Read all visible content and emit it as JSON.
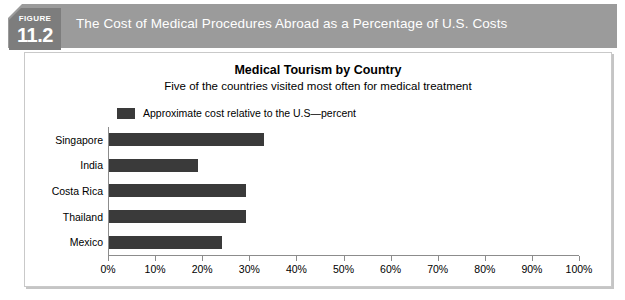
{
  "figure": {
    "kicker": "FIGURE",
    "number": "11.2",
    "header_title": "The Cost of Medical Procedures Abroad as a Percentage of U.S. Costs"
  },
  "colors": {
    "header_band": "#9b9b9b",
    "figure_box": "#7d7d7d",
    "bar": "#3a3a3a",
    "axis": "#8c8c8c",
    "panel_border": "#c9c9c9",
    "header_text": "#ffffff"
  },
  "chart_data": {
    "type": "bar",
    "orientation": "horizontal",
    "title": "Medical Tourism by Country",
    "subtitle": "Five of the countries visited most often for medical treatment",
    "xlabel": "",
    "ylabel": "",
    "xlim": [
      0,
      100
    ],
    "grid": false,
    "legend_position": "top-left",
    "legend": [
      "Approximate cost relative to the U.S—percent"
    ],
    "categories": [
      "Singapore",
      "India",
      "Costa Rica",
      "Thailand",
      "Mexico"
    ],
    "values": [
      33,
      19,
      29,
      29,
      24
    ],
    "tick_labels": [
      "0%",
      "10%",
      "20%",
      "30%",
      "40%",
      "50%",
      "60%",
      "70%",
      "80%",
      "90%",
      "100%"
    ],
    "tick_values": [
      0,
      10,
      20,
      30,
      40,
      50,
      60,
      70,
      80,
      90,
      100
    ],
    "series": [
      {
        "name": "Approximate cost relative to the U.S—percent",
        "values": [
          33,
          19,
          29,
          29,
          24
        ]
      }
    ]
  }
}
